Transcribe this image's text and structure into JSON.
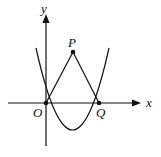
{
  "diagram": {
    "type": "coordinate-geometry",
    "axes": {
      "x_label": "x",
      "y_label": "y"
    },
    "points": {
      "origin": {
        "label": "O"
      },
      "p": {
        "label": "P"
      },
      "q": {
        "label": "Q"
      }
    },
    "curve": "parabola through O and Q, opening upward",
    "segments": [
      "OP",
      "PQ"
    ]
  }
}
